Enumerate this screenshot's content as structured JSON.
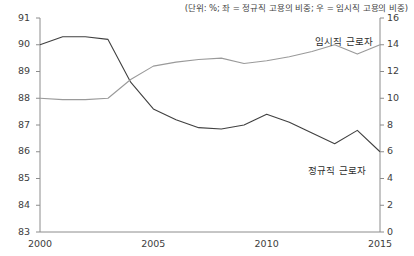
{
  "chart_data": {
    "type": "line",
    "title": "",
    "subtitle": "(단위: %; 좌 = 정규직 고용의 비중; 우 = 임시직 고용의 비중)",
    "xlabel": "",
    "ylabel": "",
    "grid": false,
    "legend_position": "inline-annotation",
    "x": [
      2000,
      2001,
      2002,
      2003,
      2004,
      2005,
      2006,
      2007,
      2008,
      2009,
      2010,
      2011,
      2012,
      2013,
      2014,
      2015
    ],
    "x_tick_labels": [
      "2000",
      "2005",
      "2010",
      "2015"
    ],
    "x_tick_values": [
      2000,
      2005,
      2010,
      2015
    ],
    "xlim": [
      2000,
      2015
    ],
    "axes": [
      {
        "id": "left",
        "name": "정규직 고용의 비중",
        "unit": "%",
        "ylim": [
          83,
          91
        ],
        "tick_labels": [
          "91",
          "90",
          "89",
          "88",
          "87",
          "86",
          "85",
          "84",
          "83"
        ],
        "tick_values": [
          91,
          90,
          89,
          88,
          87,
          86,
          85,
          84,
          83
        ]
      },
      {
        "id": "right",
        "name": "임시직 고용의 비중",
        "unit": "%",
        "ylim": [
          0,
          16
        ],
        "tick_labels": [
          "16",
          "14",
          "12",
          "10",
          "8",
          "6",
          "4",
          "2",
          "0"
        ],
        "tick_values": [
          16,
          14,
          12,
          10,
          8,
          6,
          4,
          2,
          0
        ]
      }
    ],
    "series": [
      {
        "name": "정규직 근로자",
        "axis": "left",
        "color": "#404040",
        "label_text": "정규직 근로자",
        "values": [
          90.0,
          90.3,
          90.3,
          90.2,
          88.6,
          87.6,
          87.2,
          86.9,
          86.85,
          87.0,
          87.4,
          87.1,
          86.7,
          86.3,
          86.8,
          86.0
        ]
      },
      {
        "name": "임시직 근로자",
        "axis": "right",
        "color": "#9a9a9a",
        "label_text": "임시직 근로자",
        "values": [
          10.0,
          9.9,
          9.9,
          10.0,
          11.4,
          12.4,
          12.7,
          12.9,
          13.0,
          12.6,
          12.8,
          13.1,
          13.5,
          14.0,
          13.3,
          14.0
        ]
      }
    ],
    "annotations": [
      {
        "text": "임시직 근로자",
        "x_px": 344,
        "y_px": 34
      },
      {
        "text": "정규직 근로자",
        "x_px": 337,
        "y_px": 163
      }
    ],
    "colors": {
      "axis": "#8c8c8c",
      "regular_workers_line": "#404040",
      "temporary_workers_line": "#9a9a9a",
      "text": "#3d3d3d"
    }
  }
}
